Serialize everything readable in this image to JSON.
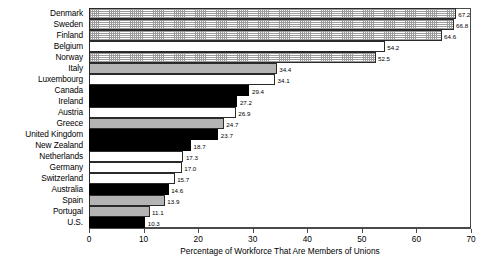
{
  "chart_data": {
    "type": "bar",
    "orientation": "horizontal",
    "title": "",
    "xlabel": "Percentage of Workforce That Are Members of Unions",
    "ylabel": "",
    "xlim": [
      0,
      70
    ],
    "xticks": [
      0,
      10,
      20,
      30,
      40,
      50,
      60,
      70
    ],
    "grid": false,
    "legend": false,
    "categories": [
      "Denmark",
      "Sweden",
      "Finland",
      "Belgium",
      "Norway",
      "Italy",
      "Luxembourg",
      "Canada",
      "Ireland",
      "Austria",
      "Greece",
      "United Kingdom",
      "New Zealand",
      "Netherlands",
      "Germany",
      "Switzerland",
      "Australia",
      "Spain",
      "Portugal",
      "U.S."
    ],
    "values": [
      67.2,
      66.8,
      64.6,
      54.2,
      52.5,
      34.4,
      34.1,
      29.4,
      27.2,
      26.9,
      24.7,
      23.7,
      18.7,
      17.3,
      17.0,
      15.7,
      14.6,
      13.9,
      11.1,
      10.3
    ],
    "value_labels": [
      "67.2",
      "66.8",
      "64.6",
      "54.2",
      "52.5",
      "34.4",
      "34.1",
      "29.4",
      "27.2",
      "26.9",
      "24.7",
      "23.7",
      "18.7",
      "17.3",
      "17.0",
      "15.7",
      "14.6",
      "13.9",
      "11.1",
      "10.3"
    ],
    "fills": [
      "dotted",
      "dotted",
      "dotted",
      "white",
      "dotted",
      "gray",
      "white",
      "black",
      "black",
      "white",
      "gray",
      "black",
      "black",
      "white",
      "white",
      "white",
      "black",
      "gray",
      "gray",
      "black"
    ]
  },
  "colors": {
    "bar_black": "#000000",
    "bar_gray": "#b4b4b4",
    "bar_white": "#ffffff",
    "axis": "#4a4a4a",
    "text": "#000000",
    "background": "#ffffff"
  }
}
